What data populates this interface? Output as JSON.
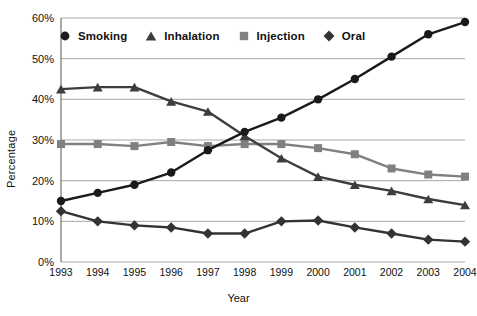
{
  "chart_data": {
    "type": "line",
    "title": "",
    "xlabel": "Year",
    "ylabel": "Percentage",
    "categories": [
      "1993",
      "1994",
      "1995",
      "1996",
      "1997",
      "1998",
      "1999",
      "2000",
      "2001",
      "2002",
      "2003",
      "2004"
    ],
    "ylim": [
      0,
      60
    ],
    "ytick_labels": [
      "0%",
      "10%",
      "20%",
      "30%",
      "40%",
      "50%",
      "60%"
    ],
    "ytick_values": [
      0,
      10,
      20,
      30,
      40,
      50,
      60
    ],
    "grid": "horizontal",
    "legend_position": "top-left-inside",
    "series": [
      {
        "name": "Smoking",
        "marker": "circle",
        "color": "#1a1a1a",
        "values": [
          15,
          17,
          19,
          22,
          27.5,
          32,
          35.5,
          40,
          45,
          50.5,
          56,
          59
        ]
      },
      {
        "name": "Inhalation",
        "marker": "triangle",
        "color": "#3d3d3d",
        "values": [
          42.5,
          43,
          43,
          39.5,
          37,
          31,
          25.5,
          21,
          19,
          17.5,
          15.5,
          14
        ]
      },
      {
        "name": "Injection",
        "marker": "square",
        "color": "#808080",
        "values": [
          29,
          29,
          28.5,
          29.5,
          28.5,
          29,
          29,
          28,
          26.5,
          23,
          21.5,
          21
        ]
      },
      {
        "name": "Oral",
        "marker": "diamond",
        "color": "#333333",
        "values": [
          12.5,
          10,
          9,
          8.5,
          7,
          7,
          10,
          10.2,
          8.5,
          7,
          5.5,
          5
        ]
      }
    ]
  },
  "colors": {
    "gridline": "#a6a6a6",
    "axis": "#555555",
    "text": "#111111",
    "background": "#ffffff"
  }
}
